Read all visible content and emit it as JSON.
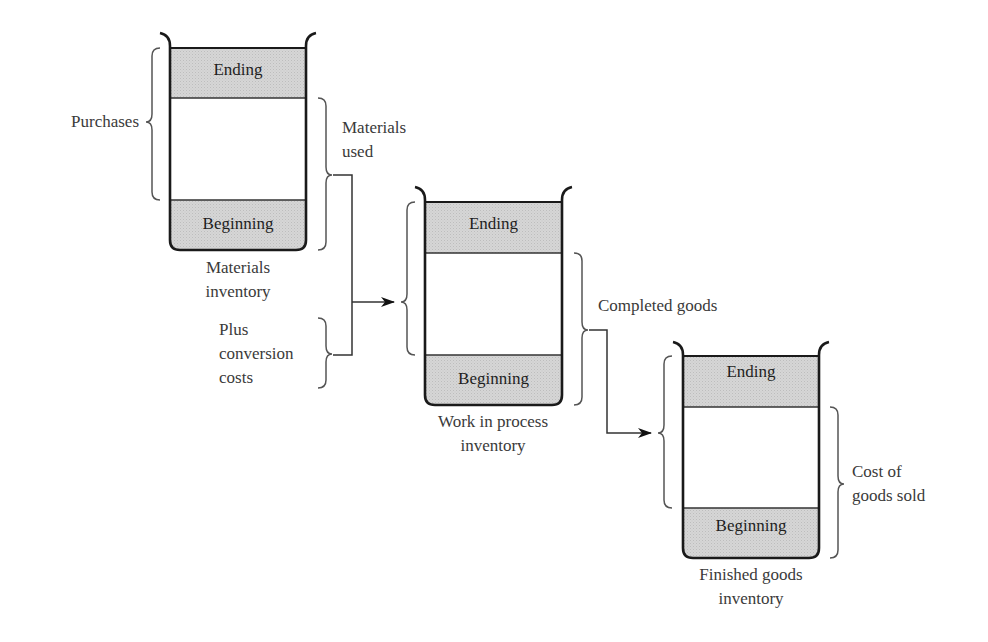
{
  "colors": {
    "fill_gray": "#d9d9d9",
    "outline": "#1a1a1a",
    "brace": "#555555",
    "text": "#3a3a3a"
  },
  "containers": [
    {
      "id": "materials",
      "top_label": "Ending",
      "bottom_label": "Beginning",
      "caption_line1": "Materials",
      "caption_line2": "inventory"
    },
    {
      "id": "work-in-process",
      "top_label": "Ending",
      "bottom_label": "Beginning",
      "caption_line1": "Work in process",
      "caption_line2": "inventory"
    },
    {
      "id": "finished-goods",
      "top_label": "Ending",
      "bottom_label": "Beginning",
      "caption_line1": "Finished goods",
      "caption_line2": "inventory"
    }
  ],
  "annotations": {
    "purchases": "Purchases",
    "materials_used_line1": "Materials",
    "materials_used_line2": "used",
    "plus_line1": "Plus",
    "plus_line2": "conversion",
    "plus_line3": "costs",
    "completed_goods": "Completed goods",
    "cogs_line1": "Cost of",
    "cogs_line2": "goods sold"
  }
}
